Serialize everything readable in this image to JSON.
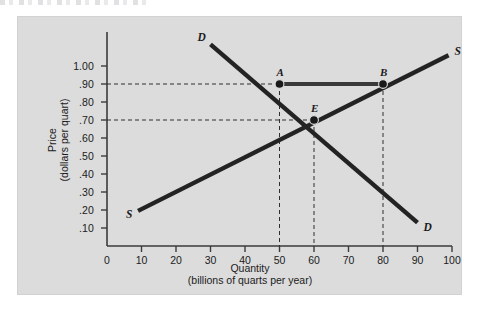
{
  "figure": {
    "background": "#dcdcdc",
    "page_background": "#ffffff",
    "ink": "#1b1b1b"
  },
  "chart_data": {
    "type": "line",
    "title": "",
    "xlabel": "Quantity",
    "xlabel_sub": "(billions of quarts per year)",
    "ylabel": "Price",
    "ylabel_sub": "(dollars per quart)",
    "xlim": [
      0,
      100
    ],
    "ylim": [
      0,
      1.05
    ],
    "grid": false,
    "legend": "inline-curve-labels",
    "xticks": [
      "0",
      "10",
      "20",
      "30",
      "40",
      "50",
      "60",
      "70",
      "80",
      "90",
      "100"
    ],
    "xtick_values": [
      0,
      10,
      20,
      30,
      40,
      50,
      60,
      70,
      80,
      90,
      100
    ],
    "yticks": [
      "1.00",
      ".90",
      ".80",
      ".70",
      ".60",
      ".50",
      ".40",
      ".30",
      ".20",
      ".10"
    ],
    "ytick_values": [
      1.0,
      0.9,
      0.8,
      0.7,
      0.6,
      0.5,
      0.4,
      0.3,
      0.2,
      0.1
    ],
    "series": [
      {
        "name": "D",
        "label": "D",
        "description": "Demand curve, downward sloping",
        "color": "#232323",
        "x": [
          30,
          90
        ],
        "y": [
          1.12,
          0.13
        ],
        "endpoint_labels": [
          "D",
          "D"
        ]
      },
      {
        "name": "S",
        "label": "S",
        "description": "Supply curve, upward sloping",
        "color": "#232323",
        "x": [
          9,
          99
        ],
        "y": [
          0.195,
          1.06
        ],
        "endpoint_labels": [
          "S",
          "S"
        ]
      }
    ],
    "points": [
      {
        "label": "A",
        "x": 50,
        "y": 0.9,
        "note": "quantity demanded at $.90"
      },
      {
        "label": "B",
        "x": 80,
        "y": 0.9,
        "note": "quantity supplied at $.90"
      },
      {
        "label": "E",
        "x": 60,
        "y": 0.7,
        "note": "equilibrium"
      }
    ],
    "annotations": [
      {
        "type": "segment",
        "from": "A",
        "to": "B",
        "y": 0.9,
        "x_from": 50,
        "x_to": 80,
        "description": "surplus bar between A and B"
      },
      {
        "type": "guide",
        "orientation": "horizontal",
        "value": 0.9
      },
      {
        "type": "guide",
        "orientation": "horizontal",
        "value": 0.7
      },
      {
        "type": "guide",
        "orientation": "vertical",
        "value": 50
      },
      {
        "type": "guide",
        "orientation": "vertical",
        "value": 60
      },
      {
        "type": "guide",
        "orientation": "vertical",
        "value": 80
      }
    ]
  }
}
